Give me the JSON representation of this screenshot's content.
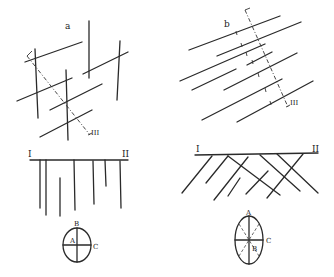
{
  "figure": {
    "panels": [
      {
        "id": "a",
        "label": "a",
        "axis_label": "III",
        "description": "Intersecting vertical and inclined line sets with dash-dot section line"
      },
      {
        "id": "b",
        "label": "b",
        "axis_label": "III",
        "description": "Parallel inclined lines with tick marks crossed by dash-dot section line"
      },
      {
        "id": "c",
        "start_label": "I",
        "end_label": "II",
        "description": "Vertical lines hanging from horizontal profile I–II"
      },
      {
        "id": "d",
        "start_label": "I",
        "end_label": "II",
        "description": "Crossing diagonal lines hanging from horizontal profile I–II"
      }
    ],
    "ellipse_left": {
      "label_top": "B",
      "label_center": "A",
      "label_right": "C"
    },
    "ellipse_right": {
      "label_top": "A",
      "label_center": "B",
      "label_right": "C"
    }
  }
}
